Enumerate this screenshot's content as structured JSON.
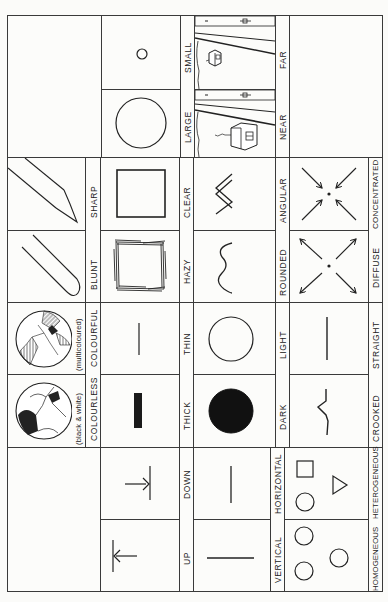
{
  "orientation": "rotated 90 degrees counter-clockwise",
  "rows": [
    {
      "pairs": [
        {
          "a": "LARGE",
          "b": "SMALL",
          "a_icon": "large-circle-icon",
          "b_icon": "small-circle-icon"
        },
        {
          "a": "NEAR",
          "b": "FAR",
          "a_icon": "near-house-road-icon",
          "b_icon": "far-house-road-icon"
        }
      ]
    },
    {
      "pairs": [
        {
          "a": "BLUNT",
          "b": "SHARP",
          "a_icon": "blunt-pencil-icon",
          "b_icon": "sharp-pencil-icon"
        },
        {
          "a": "HAZY",
          "b": "CLEAR",
          "a_icon": "hazy-square-icon",
          "b_icon": "clear-square-icon"
        },
        {
          "a": "ROUNDED",
          "b": "ANGULAR",
          "a_icon": "wavy-line-icon",
          "b_icon": "zigzag-line-icon"
        },
        {
          "a": "DIFFUSE",
          "b": "CONCENTRATED",
          "a_icon": "arrows-outward-icon",
          "b_icon": "arrows-inward-icon"
        }
      ]
    },
    {
      "pairs": [
        {
          "a": "COLOURLESS",
          "b": "COLOURFUL",
          "a_note": "(black & white)",
          "b_note": "(multicoloured)",
          "a_icon": "black-white-ball-icon",
          "b_icon": "multicoloured-ball-icon"
        },
        {
          "a": "THICK",
          "b": "THIN",
          "a_icon": "thick-bar-icon",
          "b_icon": "thin-line-icon"
        },
        {
          "a": "DARK",
          "b": "LIGHT",
          "a_icon": "filled-circle-icon",
          "b_icon": "outline-circle-icon"
        },
        {
          "a": "CROOKED",
          "b": "STRAIGHT",
          "a_icon": "crooked-line-icon",
          "b_icon": "straight-line-icon"
        }
      ]
    },
    {
      "pairs": [
        {
          "a": "UP",
          "b": "DOWN",
          "a_icon": "arrow-up-icon",
          "b_icon": "arrow-down-icon"
        },
        {
          "a": "VERTICAL",
          "b": "HORIZONTAL",
          "a_icon": "vertical-line-icon",
          "b_icon": "horizontal-line-icon"
        },
        {
          "a": "HOMOGENEOUS",
          "b": "HETEROGENEOUS",
          "a_icon": "three-circles-icon",
          "b_icon": "mixed-shapes-icon"
        }
      ]
    }
  ]
}
